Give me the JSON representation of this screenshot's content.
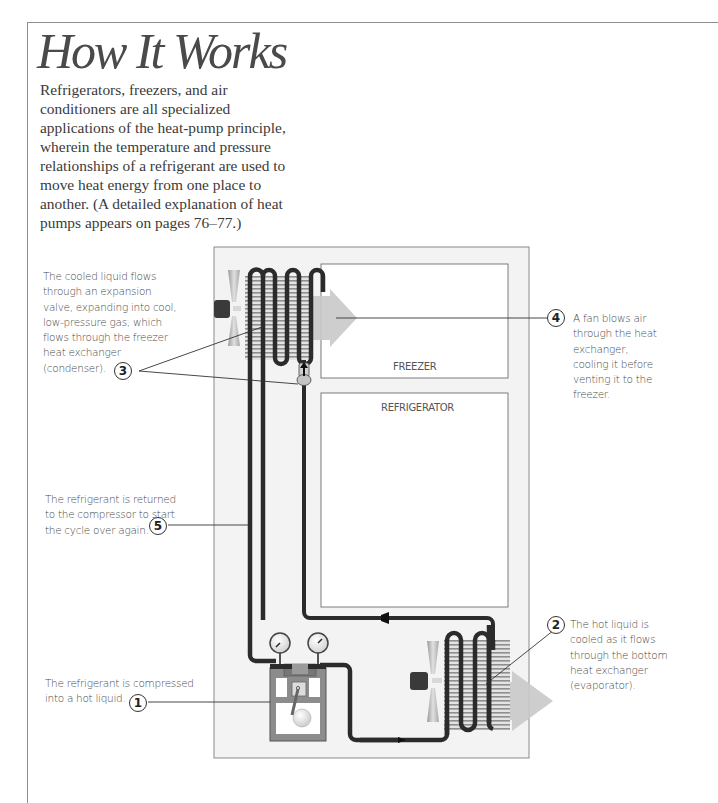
{
  "header": {
    "title": "How It Works",
    "intro": "Refrigerators, freezers, and air conditioners are all specialized applications of the heat-pump principle, wherein the temperature and pressure relationships of a refrigerant are used to move heat energy from one place to another. (A detailed explanation of heat pumps appears on pages 76–77.)"
  },
  "diagram": {
    "compartments": {
      "freezer": "FREEZER",
      "refrigerator": "REFRIGERATOR"
    },
    "colors": {
      "cabinet_fill": "#f2f2f2",
      "pipe": "#2b2b2b",
      "airflow_arrow": "#c8c8c8",
      "fin": "#9a9a9a",
      "fan_blade": "#bdbdbd",
      "motor": "#3a3a3a"
    },
    "callouts": [
      {
        "number": "1",
        "text": "The refrigerant is compressed into a hot liquid."
      },
      {
        "number": "2",
        "text": "The hot liquid is cooled as it flows through the bottom heat exchanger (evaporator)."
      },
      {
        "number": "3",
        "text": "The cooled liquid flows through an expansion valve, expanding into cool, low-pressure gas, which flows through the freezer heat exchanger (condenser)."
      },
      {
        "number": "4",
        "text": "A fan blows air through the heat exchanger, cooling it before venting it to the freezer."
      },
      {
        "number": "5",
        "text": "The refrigerant is returned to the compressor to start the cycle over again."
      }
    ]
  }
}
